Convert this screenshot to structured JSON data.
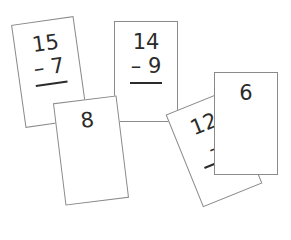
{
  "cards": [
    {
      "id": "card-15-minus-7",
      "top": "15",
      "operator": "–",
      "bottom": "7"
    },
    {
      "id": "card-14-minus-9",
      "top": "14",
      "operator": "–",
      "bottom": "9"
    },
    {
      "id": "card-answer-8",
      "value": "8"
    },
    {
      "id": "card-12-minus",
      "top": "12",
      "operator": "–"
    },
    {
      "id": "card-answer-6",
      "value": "6"
    }
  ]
}
